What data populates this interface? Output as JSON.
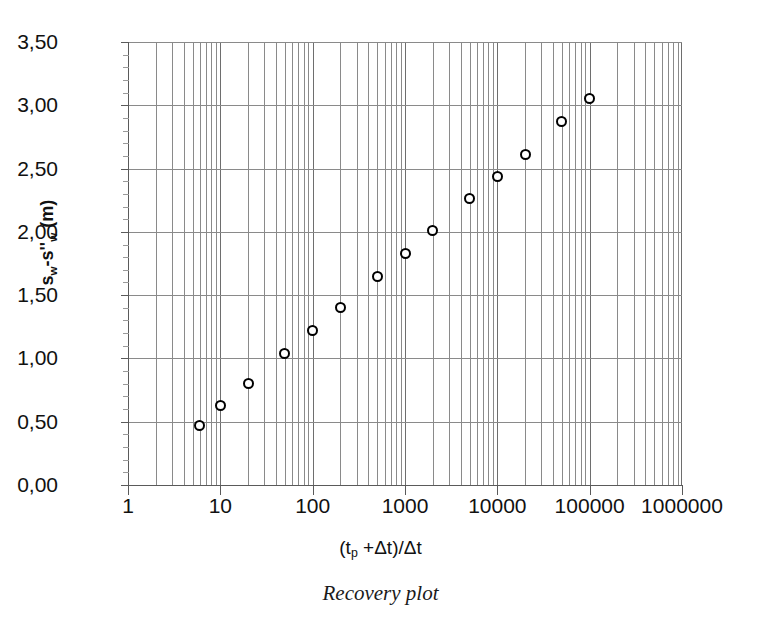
{
  "caption": "Recovery plot",
  "chart_data": {
    "type": "scatter",
    "title": "",
    "subtitle": "",
    "caption": "Recovery plot",
    "xlabel": "(t_p +Δt)/Δt",
    "xlabel_parts": {
      "open": "(t",
      "sub": "p",
      "rest": " +Δt)/Δt"
    },
    "ylabel": "s_w-s''_w (m)",
    "ylabel_parts": {
      "s1": "s",
      "sub1": "w",
      "mid": "-s''",
      "sub2": "w",
      "units": " (m)"
    },
    "xscale": "log",
    "yscale": "linear",
    "xlim": [
      1,
      1000000
    ],
    "ylim": [
      0.0,
      3.5
    ],
    "grid": "major-and-minor-log-vertical, major-horizontal",
    "legend": "none",
    "marker": "open-circle",
    "decimal_separator": ",",
    "xticks": [
      1,
      10,
      100,
      1000,
      10000,
      100000,
      1000000
    ],
    "xticklabels": [
      "1",
      "10",
      "100",
      "1000",
      "10000",
      "100000",
      "1000000"
    ],
    "yticks": [
      0.0,
      0.5,
      1.0,
      1.5,
      2.0,
      2.5,
      3.0,
      3.5
    ],
    "yticklabels": [
      "0,00",
      "0,50",
      "1,00",
      "1,50",
      "2,00",
      "2,50",
      "3,00",
      "3,50"
    ],
    "y_minor_step": 0.1,
    "series": [
      {
        "name": "recovery",
        "x": [
          6,
          10,
          20,
          50,
          100,
          200,
          500,
          1000,
          2000,
          5000,
          10000,
          20000,
          50000,
          100000
        ],
        "y": [
          0.47,
          0.63,
          0.8,
          1.04,
          1.22,
          1.4,
          1.65,
          1.83,
          2.01,
          2.26,
          2.44,
          2.61,
          2.87,
          3.05
        ]
      }
    ]
  }
}
